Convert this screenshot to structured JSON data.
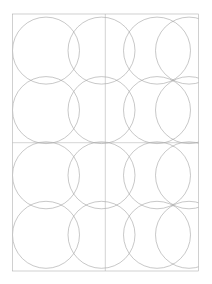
{
  "document": {
    "title": "Circle Grid Geometric Construction",
    "background_color": "#ffffff",
    "canvas_width": 212,
    "canvas_height": 284
  },
  "drawing": {
    "name": "overlapping-circle-lattice",
    "stroke_color": "#9a9a9a",
    "stroke_color_frame": "#aaaaaa",
    "stroke_color_axis": "#b0b0b0",
    "stroke_width": 0.55,
    "fill": "none"
  },
  "frame": {
    "name": "page-border-rectangle",
    "x": 12.5,
    "y": 14.0,
    "width": 186.0,
    "height": 257.0
  },
  "axes": {
    "vertical_center_line": {
      "x": 105.3,
      "y1": 14.0,
      "y2": 271.0
    },
    "horizontal_center_line": {
      "y": 142.7,
      "x1": 12.5,
      "x2": 198.5
    }
  },
  "circle_grid": {
    "columns": 4,
    "rows": 4,
    "radius": 33.5,
    "center_x_positions": [
      46.0,
      101.5,
      157.0,
      189.0
    ],
    "center_y_positions": [
      50.6,
      110.1,
      175.3,
      234.8
    ],
    "column_spacing": 55.5,
    "row_spacing": 59.5
  },
  "circles": [
    {
      "id": "circle-r1c1",
      "cx": 46.0,
      "cy": 50.6,
      "r": 33.5
    },
    {
      "id": "circle-r1c2",
      "cx": 101.5,
      "cy": 50.6,
      "r": 33.5
    },
    {
      "id": "circle-r1c3",
      "cx": 157.0,
      "cy": 50.6,
      "r": 33.5
    },
    {
      "id": "circle-r1c4",
      "cx": 189.0,
      "cy": 50.6,
      "r": 33.5
    },
    {
      "id": "circle-r2c1",
      "cx": 46.0,
      "cy": 110.1,
      "r": 33.5
    },
    {
      "id": "circle-r2c2",
      "cx": 101.5,
      "cy": 110.1,
      "r": 33.5
    },
    {
      "id": "circle-r2c3",
      "cx": 157.0,
      "cy": 110.1,
      "r": 33.5
    },
    {
      "id": "circle-r2c4",
      "cx": 189.0,
      "cy": 110.1,
      "r": 33.5
    },
    {
      "id": "circle-r3c1",
      "cx": 46.0,
      "cy": 175.3,
      "r": 33.5
    },
    {
      "id": "circle-r3c2",
      "cx": 101.5,
      "cy": 175.3,
      "r": 33.5
    },
    {
      "id": "circle-r3c3",
      "cx": 157.0,
      "cy": 175.3,
      "r": 33.5
    },
    {
      "id": "circle-r3c4",
      "cx": 189.0,
      "cy": 175.3,
      "r": 33.5
    },
    {
      "id": "circle-r4c1",
      "cx": 46.0,
      "cy": 234.8,
      "r": 33.5
    },
    {
      "id": "circle-r4c2",
      "cx": 101.5,
      "cy": 234.8,
      "r": 33.5
    },
    {
      "id": "circle-r4c3",
      "cx": 157.0,
      "cy": 234.8,
      "r": 33.5
    },
    {
      "id": "circle-r4c4",
      "cx": 189.0,
      "cy": 234.8,
      "r": 33.5
    }
  ]
}
